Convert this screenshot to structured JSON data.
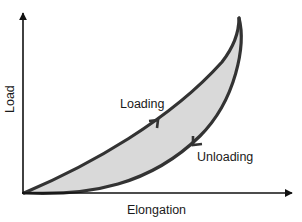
{
  "diagram": {
    "x_axis_label": "Elongation",
    "y_axis_label": "Load",
    "curves": [
      {
        "name": "Loading",
        "label": "Loading",
        "direction": "up"
      },
      {
        "name": "Unloading",
        "label": "Unloading",
        "direction": "down"
      }
    ],
    "colors": {
      "curve": "#333333",
      "fill": "#d9d9d9",
      "axis": "#111111",
      "text": "#1a1a1a",
      "background": "#ffffff"
    }
  }
}
